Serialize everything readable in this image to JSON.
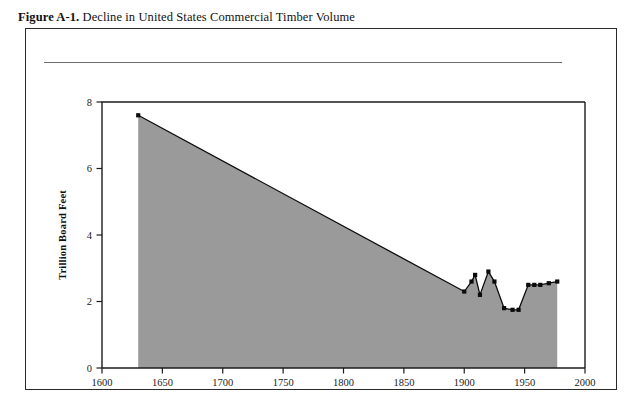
{
  "figure": {
    "number_label": "Figure A-1.",
    "caption": " Decline in United States Commercial Timber Volume"
  },
  "colors": {
    "area_fill": "#9a9a9a",
    "line": "#0d0d0d",
    "axis": "#1d1d1d",
    "frame": "#2a2a2a",
    "rule": "#6e6e6e"
  },
  "chart_data": {
    "type": "area",
    "title": "Decline in United States Commercial Timber Volume",
    "xlabel": "",
    "ylabel": "Trillion Board Feet",
    "xlim": [
      1600,
      2000
    ],
    "ylim": [
      0,
      8
    ],
    "xticks": [
      1600,
      1650,
      1700,
      1750,
      1800,
      1850,
      1900,
      1950,
      2000
    ],
    "xticklabels": [
      "1600",
      "1650",
      "1700",
      "1750",
      "1800",
      "1850",
      "1900",
      "1950",
      "2000"
    ],
    "yticks": [
      0,
      2,
      4,
      6,
      8
    ],
    "yticklabels": [
      "0",
      "2",
      "4",
      "6",
      "8"
    ],
    "grid": false,
    "legend": false,
    "markers_from_year": 1900,
    "series": [
      {
        "name": "US Commercial Timber Volume",
        "x": [
          1630,
          1900,
          1906,
          1909,
          1913,
          1920,
          1925,
          1933,
          1940,
          1945,
          1953,
          1958,
          1963,
          1970,
          1977
        ],
        "y": [
          7.6,
          2.3,
          2.6,
          2.8,
          2.2,
          2.9,
          2.6,
          1.8,
          1.75,
          1.75,
          2.5,
          2.5,
          2.5,
          2.55,
          2.6
        ]
      }
    ]
  }
}
